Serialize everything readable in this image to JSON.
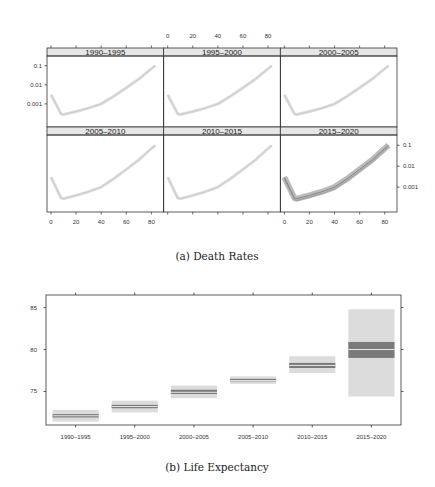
{
  "captions": {
    "a": "(a) Death Rates",
    "b": "(b) Life Expectancy"
  },
  "chart_data": [
    {
      "type": "line",
      "title": "(a) Death Rates",
      "panels": [
        "1990–1995",
        "1995–2000",
        "2000–2005",
        "2005–2010",
        "2010–2015",
        "2015–2020"
      ],
      "layout": {
        "rows": 2,
        "cols": 3
      },
      "x_ticks": [
        "0",
        "20",
        "40",
        "60",
        "80"
      ],
      "y_ticks": [
        "0.1",
        "0.01",
        "0.001"
      ],
      "y_scale": "log",
      "xlim": [
        0,
        85
      ],
      "series_description": "Age-specific death rate curves with uncertainty bands; widest band in 2015–2020",
      "approx_curve": {
        "x": [
          0,
          8,
          10,
          20,
          30,
          40,
          50,
          60,
          70,
          80,
          83
        ],
        "y": [
          0.003,
          0.0003,
          0.00028,
          0.0004,
          0.0006,
          0.001,
          0.0025,
          0.007,
          0.02,
          0.07,
          0.1
        ]
      }
    },
    {
      "type": "bar",
      "title": "(b) Life Expectancy",
      "categories": [
        "1990–1995",
        "1995–2000",
        "2000–2005",
        "2005–2010",
        "2010–2015",
        "2015–2020"
      ],
      "y_ticks": [
        "85",
        "80",
        "75"
      ],
      "ylim": [
        71,
        86.5
      ],
      "series": [
        {
          "name": "median",
          "values": [
            72.1,
            73.2,
            74.9,
            76.3,
            78.1,
            80.0
          ]
        },
        {
          "name": "inner_low",
          "values": [
            71.9,
            73.0,
            74.7,
            76.2,
            77.8,
            79.0
          ]
        },
        {
          "name": "inner_high",
          "values": [
            72.3,
            73.4,
            75.2,
            76.5,
            78.4,
            80.9
          ]
        },
        {
          "name": "outer_low",
          "values": [
            71.4,
            72.5,
            74.2,
            75.9,
            77.2,
            74.4
          ]
        },
        {
          "name": "outer_high",
          "values": [
            72.8,
            73.9,
            75.7,
            76.8,
            79.2,
            84.8
          ]
        }
      ]
    }
  ]
}
